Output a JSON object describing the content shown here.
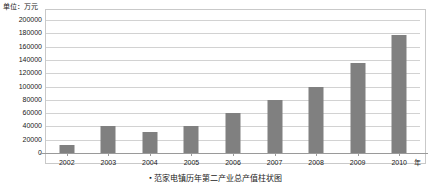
{
  "chart_data": {
    "type": "bar",
    "title": "范家电镇历年第二产业总产值柱状图",
    "unit_label": "单位：万元",
    "xlabel": "年",
    "ylabel": "",
    "categories": [
      "2002",
      "2003",
      "2004",
      "2005",
      "2006",
      "2007",
      "2008",
      "2009",
      "2010"
    ],
    "values": [
      12000,
      40000,
      32000,
      40000,
      60000,
      80000,
      100000,
      135000,
      178000
    ],
    "ylim": [
      0,
      200000
    ],
    "ytick_step": 20000,
    "yticks": [
      "200000",
      "180000",
      "160000",
      "140000",
      "120000",
      "100000",
      "80000",
      "60000",
      "40000",
      "20000",
      "0"
    ],
    "ytick_values": [
      200000,
      180000,
      160000,
      140000,
      120000,
      100000,
      80000,
      60000,
      40000,
      20000,
      0
    ],
    "grid": true,
    "legend": "none",
    "bar_color": "#808080",
    "grid_color": "#d2d2d2",
    "axis_color": "#9a9a9a",
    "frame_color": "#c9c9c9"
  },
  "caption": {
    "bullet": "▪",
    "text": "范家电镇历年第二产业总产值柱状图"
  }
}
